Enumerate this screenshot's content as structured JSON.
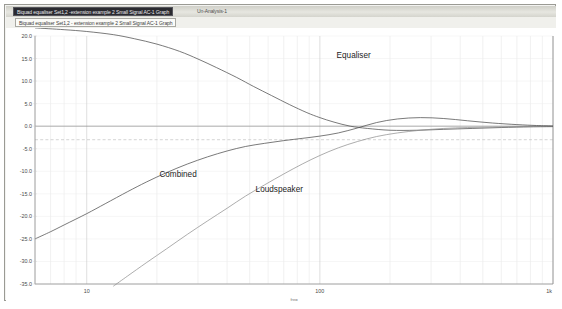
{
  "window": {
    "title_selected": "Biquad equaliser Set1,2 -extension example 2 Small Signal AC-1 Graph",
    "title_unselected": "Un-Analysis-1"
  },
  "tab": {
    "label": "Biquad equaliser Set1,2 - extension example 2 Small Signal AC-1 Graph"
  },
  "chart_data": {
    "type": "line",
    "title": "",
    "xlabel": "freq",
    "ylabel": "",
    "xscale": "log",
    "xlim": [
      6,
      1000
    ],
    "ylim": [
      -35,
      20
    ],
    "grid": true,
    "legend": "inline-annotations",
    "xticks": [
      10,
      100,
      1000
    ],
    "xtick_labels": [
      "10",
      "100",
      "1k"
    ],
    "yticks": [
      20,
      15,
      10,
      5,
      0,
      -5,
      -10,
      -15,
      -20,
      -25,
      -30,
      -35
    ],
    "ytick_labels": [
      "20.0",
      "15.0",
      "10.0",
      "5.0",
      "0.0",
      "-5.0",
      "-10.0",
      "-15.0",
      "-20.0",
      "-25.0",
      "-30.0",
      "-35.0"
    ],
    "reference_lines": [
      {
        "y": 0,
        "style": "solid",
        "label": "0 dB"
      },
      {
        "y": -3,
        "style": "dashed",
        "label": "-3 dB"
      }
    ],
    "series": [
      {
        "name": "Equaliser",
        "label_x": 118,
        "label_y": 15.1,
        "x": [
          6,
          8,
          10,
          13,
          16,
          20,
          25,
          30,
          36,
          44,
          52,
          62,
          74,
          88,
          100,
          115,
          135,
          160,
          200,
          260,
          340,
          450,
          600,
          800,
          1000
        ],
        "y": [
          21.8,
          21.4,
          21.0,
          20.3,
          19.4,
          18.2,
          16.6,
          14.9,
          13.0,
          10.8,
          8.8,
          6.8,
          4.8,
          3.0,
          1.9,
          0.9,
          0.0,
          -0.5,
          -0.9,
          -0.9,
          -0.7,
          -0.5,
          -0.3,
          -0.15,
          -0.1
        ]
      },
      {
        "name": "Loudspeaker",
        "label_x": 53,
        "label_y": -14.7,
        "x": [
          13,
          15,
          18,
          22,
          27,
          33,
          40,
          48,
          58,
          70,
          84,
          100,
          120,
          145,
          175,
          215,
          270,
          340,
          430,
          550,
          700,
          850,
          1000
        ],
        "y": [
          -35.5,
          -33.2,
          -30.3,
          -27.2,
          -24.0,
          -21.0,
          -18.2,
          -15.5,
          -13.0,
          -10.6,
          -8.4,
          -6.5,
          -4.8,
          -3.4,
          -2.3,
          -1.5,
          -0.9,
          -0.5,
          -0.3,
          -0.2,
          -0.1,
          -0.05,
          0.0
        ]
      },
      {
        "name": "Combined",
        "label_x": 20.5,
        "label_y": -11.2,
        "x": [
          6,
          7,
          8,
          10,
          12,
          15,
          18,
          22,
          27,
          33,
          40,
          48,
          58,
          70,
          84,
          100,
          120,
          145,
          175,
          215,
          270,
          340,
          430,
          550,
          700,
          850,
          1000
        ],
        "y": [
          -25.0,
          -23.4,
          -21.9,
          -19.4,
          -17.2,
          -14.5,
          -12.4,
          -10.3,
          -8.4,
          -6.8,
          -5.5,
          -4.5,
          -3.8,
          -3.2,
          -2.7,
          -2.2,
          -1.5,
          -0.4,
          0.8,
          1.6,
          1.9,
          1.7,
          1.2,
          0.7,
          0.35,
          0.15,
          0.05
        ]
      }
    ]
  }
}
